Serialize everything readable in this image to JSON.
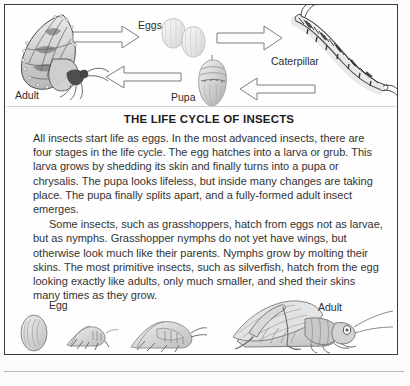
{
  "document": {
    "title": "THE LIFE CYCLE OF INSECTS",
    "paragraphs": [
      "All insects start life as eggs. In the most advanced insects, there are four stages in the life cycle. The egg hatches into a larva or grub. This larva grows by shedding its skin and finally turns into a pupa or chrysalis. The pupa looks lifeless, but inside many changes are taking place. The pupa finally splits apart, and a fully-formed adult insect emerges.",
      "Some insects, such as grasshoppers, hatch from eggs not as larvae, but as nymphs. Grasshopper nymphs do not yet have wings, but otherwise look much like their parents. Nymphs grow by molting their skins. The most primitive insects, such as silverfish, hatch from the egg looking exactly like adults, only much smaller, and shed their skins many times as they grow."
    ]
  },
  "cycle_diagram": {
    "labels": {
      "adult": "Adult",
      "eggs": "Eggs",
      "caterpillar": "Caterpillar",
      "pupa": "Pupa"
    },
    "stages": [
      "Adult",
      "Eggs",
      "Caterpillar",
      "Pupa"
    ],
    "arrows": [
      "adult-to-eggs",
      "eggs-to-caterpillar",
      "caterpillar-to-pupa",
      "pupa-to-adult"
    ]
  },
  "grasshopper_strip": {
    "labels": {
      "egg": "Egg",
      "adult": "Adult"
    },
    "stages": [
      "Egg",
      "Nymph 1",
      "Nymph 2",
      "Adult"
    ]
  },
  "colors": {
    "ink": "#2b2b2b",
    "border": "#3a3a3a",
    "paper": "#fefefe",
    "pencil": "#8d8d8d"
  }
}
